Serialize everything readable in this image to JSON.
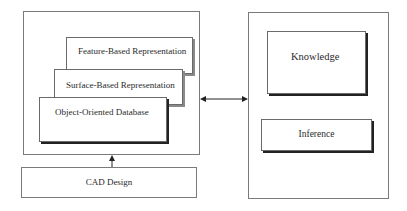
{
  "diagram": {
    "left_group": {
      "layers": [
        {
          "label": "Feature-Based Representation"
        },
        {
          "label": "Surface-Based Representation"
        },
        {
          "label": "Object-Oriented Database"
        }
      ]
    },
    "input": {
      "label": "CAD Design"
    },
    "right_group": {
      "components": [
        {
          "label": "Knowledge"
        },
        {
          "label": "Inference"
        }
      ]
    },
    "connections": [
      {
        "from": "CAD Design",
        "to": "left_group",
        "type": "single-arrow-up"
      },
      {
        "from": "left_group",
        "to": "right_group",
        "type": "double-arrow"
      }
    ]
  }
}
